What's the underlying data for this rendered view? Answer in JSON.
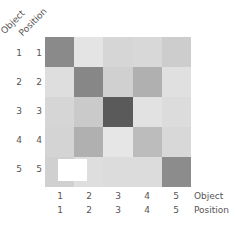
{
  "chart_data": {
    "type": "heatmap",
    "title": "",
    "row_axis_labels": [
      "Object",
      "Position"
    ],
    "col_axis_labels": [
      "Object",
      "Position"
    ],
    "rows": {
      "object": [
        "1",
        "2",
        "3",
        "4",
        "5"
      ],
      "position": [
        "1",
        "2",
        "3",
        "4",
        "5"
      ]
    },
    "cols": {
      "object": [
        "1",
        "2",
        "3",
        "4",
        "5"
      ],
      "position": [
        "1",
        "2",
        "3",
        "4",
        "5"
      ]
    },
    "values": [
      [
        0.55,
        0.1,
        0.18,
        0.16,
        0.22
      ],
      [
        0.13,
        0.57,
        0.2,
        0.33,
        0.12
      ],
      [
        0.18,
        0.23,
        0.75,
        0.11,
        0.14
      ],
      [
        0.19,
        0.33,
        0.09,
        0.27,
        0.16
      ],
      [
        0.2,
        0.13,
        0.14,
        0.14,
        0.53
      ]
    ],
    "colors": [
      [
        "#8a8a8a",
        "#e4e4e4",
        "#d6d6d6",
        "#d8d8d8",
        "#cdcdcd"
      ],
      [
        "#dedede",
        "#878787",
        "#d0d0d0",
        "#b0b0b0",
        "#e0e0e0"
      ],
      [
        "#d6d6d6",
        "#cacaca",
        "#5a5a5a",
        "#e2e2e2",
        "#dcdcdc"
      ],
      [
        "#d4d4d4",
        "#b0b0b0",
        "#e6e6e6",
        "#bcbcbc",
        "#d8d8d8"
      ],
      [
        "#d0d0d0",
        "#dedede",
        "#dcdcdc",
        "#dcdcdc",
        "#8c8c8c"
      ]
    ],
    "annotations": [
      "white highlight box at row 5 near column 1"
    ],
    "colormap": "grayscale (darker = higher)",
    "grid": false,
    "legend": "none"
  },
  "labels": {
    "corner_object": "Object",
    "corner_position": "Position",
    "bottom_object": "Object",
    "bottom_position": "Position",
    "row_object": [
      "1",
      "2",
      "3",
      "4",
      "5"
    ],
    "row_position": [
      "1",
      "2",
      "3",
      "4",
      "5"
    ],
    "col_object": [
      "1",
      "2",
      "3",
      "4",
      "5"
    ],
    "col_position": [
      "1",
      "2",
      "3",
      "4",
      "5"
    ]
  }
}
